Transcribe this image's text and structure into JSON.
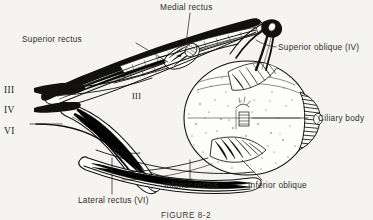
{
  "figure": {
    "caption": "FIGURE 8-2",
    "background_color": "#f6f4f1",
    "ink_color": "#121110",
    "text_color": "#2e2b28"
  },
  "labels": {
    "medial_rectus": "Medial rectus",
    "superior_rectus": "Superior rectus",
    "superior_oblique": "Superior oblique (IV)",
    "ciliary_body": "Ciliary body",
    "inferior_rectus": "Inferior rectus",
    "inferior_oblique": "Inferior oblique",
    "lateral_rectus": "Lateral rectus (VI)",
    "nerve_three_left": "III",
    "nerve_four_left": "IV",
    "nerve_six_left": "VI",
    "nerve_three_inner": "III"
  },
  "structures": [
    {
      "name": "medial-rectus-muscle",
      "label": "Medial rectus",
      "nerve": "III"
    },
    {
      "name": "superior-rectus-muscle",
      "label": "Superior rectus",
      "nerve": "III"
    },
    {
      "name": "superior-oblique-muscle",
      "label": "Superior oblique (IV)",
      "nerve": "IV"
    },
    {
      "name": "inferior-rectus-muscle",
      "label": "Inferior rectus",
      "nerve": "III"
    },
    {
      "name": "inferior-oblique-muscle",
      "label": "Inferior oblique",
      "nerve": "III"
    },
    {
      "name": "lateral-rectus-muscle",
      "label": "Lateral rectus (VI)",
      "nerve": "VI"
    },
    {
      "name": "ciliary-body",
      "label": "Ciliary body",
      "nerve": ""
    }
  ],
  "cranial_nerves": [
    {
      "numeral": "III",
      "name": "oculomotor-nerve"
    },
    {
      "numeral": "IV",
      "name": "trochlear-nerve"
    },
    {
      "numeral": "VI",
      "name": "abducens-nerve"
    }
  ]
}
